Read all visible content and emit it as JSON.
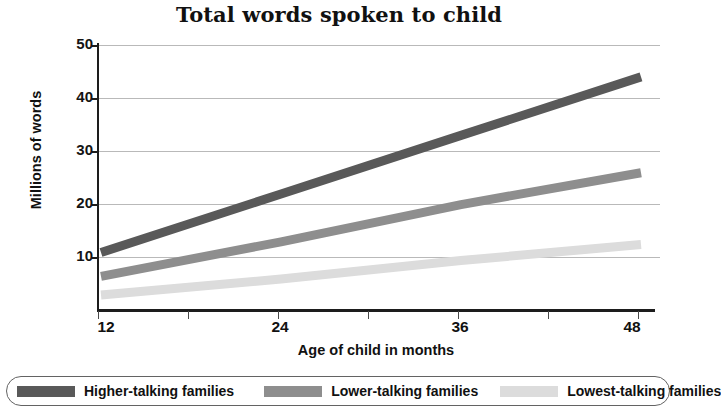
{
  "chart_data": {
    "type": "line",
    "title": "Total words spoken to child",
    "xlabel": "Age of child in months",
    "ylabel": "Millions of words",
    "x": [
      12,
      24,
      36,
      48
    ],
    "xticks": [
      12,
      24,
      36,
      48
    ],
    "xtick_labels": [
      "12",
      "24",
      "36",
      "48"
    ],
    "xlim": [
      12,
      48
    ],
    "yticks": [
      10,
      20,
      30,
      40,
      50
    ],
    "ytick_labels": [
      "10",
      "20",
      "30",
      "40",
      "50"
    ],
    "ylim": [
      0,
      50
    ],
    "grid": true,
    "legend_position": "bottom",
    "series": [
      {
        "name": "Higher-talking families",
        "color": "#595959",
        "values": [
          11,
          22,
          33,
          44
        ]
      },
      {
        "name": "Lower-talking families",
        "color": "#8e8e8e",
        "values": [
          6.5,
          13,
          20,
          26
        ]
      },
      {
        "name": "Lowest-talking families",
        "color": "#dcdcdc",
        "values": [
          3,
          6,
          9.5,
          12.5
        ]
      }
    ]
  },
  "axes": {
    "yticks": [
      {
        "label": "50",
        "value": 50
      },
      {
        "label": "40",
        "value": 40
      },
      {
        "label": "30",
        "value": 30
      },
      {
        "label": "20",
        "value": 20
      },
      {
        "label": "10",
        "value": 10
      }
    ],
    "xticks": [
      {
        "label": "12",
        "value": 12
      },
      {
        "label": "",
        "value": 18
      },
      {
        "label": "24",
        "value": 24
      },
      {
        "label": "",
        "value": 30
      },
      {
        "label": "36",
        "value": 36
      },
      {
        "label": "",
        "value": 42
      },
      {
        "label": "48",
        "value": 48
      }
    ]
  },
  "legend": {
    "items": [
      {
        "label": "Higher-talking families",
        "color": "#595959"
      },
      {
        "label": "Lower-talking families",
        "color": "#8e8e8e"
      },
      {
        "label": "Lowest-talking families",
        "color": "#dcdcdc"
      }
    ]
  },
  "colors": {
    "higher": "#595959",
    "lower": "#8e8e8e",
    "lowest": "#dcdcdc",
    "axis": "#1d1d1d",
    "grid": "#b9b9b9",
    "text": "#111111"
  }
}
